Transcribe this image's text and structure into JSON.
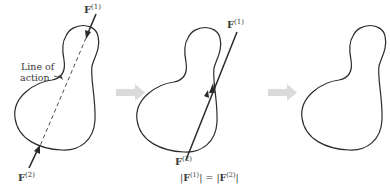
{
  "figure": {
    "panels": [
      {
        "id": "panel-1",
        "force_top_label": "F",
        "force_top_superscript": "(1)",
        "force_bottom_label": "F",
        "force_bottom_superscript": "(2)",
        "annotation_line1": "Line of",
        "annotation_line2": "action"
      },
      {
        "id": "panel-2",
        "force_top_label": "F",
        "force_top_superscript": "(1)",
        "force_bottom_label": "F",
        "force_bottom_superscript": "(2)",
        "equation": {
          "lhs_bar_open": "|",
          "lhs_symbol": "F",
          "lhs_superscript": "(1)",
          "lhs_bar_close": "|",
          "equals": " = ",
          "rhs_bar_open": "|",
          "rhs_symbol": "F",
          "rhs_superscript": "(2)",
          "rhs_bar_close": "|"
        }
      },
      {
        "id": "panel-3"
      }
    ],
    "transition_arrows": [
      {
        "id": "arrow-1",
        "icon": "right-arrow-icon"
      },
      {
        "id": "arrow-2",
        "icon": "right-arrow-icon"
      }
    ],
    "colors": {
      "stroke": "#2b2b2b",
      "transition_arrow": "#d9d9d9",
      "text": "#3a3a3a"
    }
  }
}
